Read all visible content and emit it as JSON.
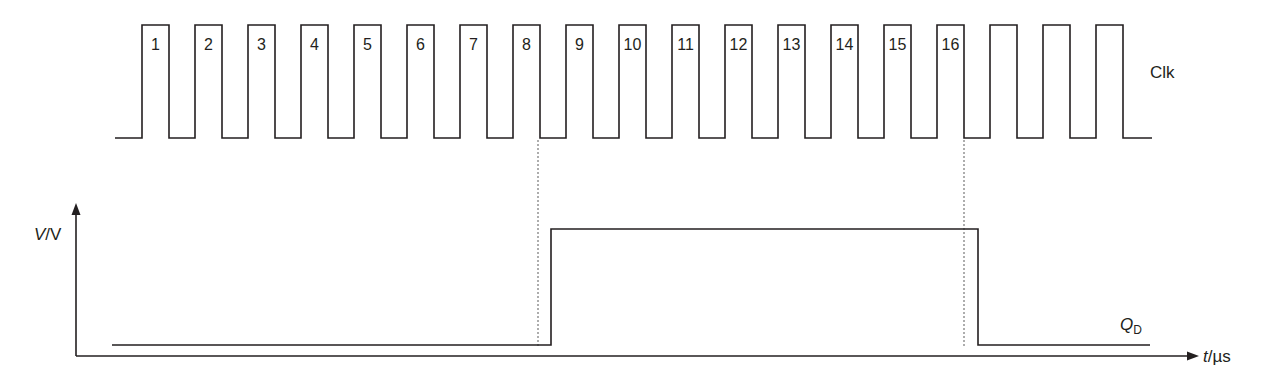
{
  "diagram": {
    "clock": {
      "label": "Clk",
      "pulse_count": 19,
      "pulse_labels": [
        "1",
        "2",
        "3",
        "4",
        "5",
        "6",
        "7",
        "8",
        "9",
        "10",
        "11",
        "12",
        "13",
        "14",
        "15",
        "16",
        "",
        "",
        ""
      ]
    },
    "output": {
      "label_main": "Q",
      "label_sub": "D",
      "rises_after_pulse": 8,
      "falls_after_pulse": 16
    },
    "axes": {
      "y_label_var": "V",
      "y_label_unit": "/V",
      "x_label_var": "t",
      "x_label_unit": "/µs"
    },
    "colors": {
      "line": "#231f20",
      "dotted": "#777777"
    }
  }
}
